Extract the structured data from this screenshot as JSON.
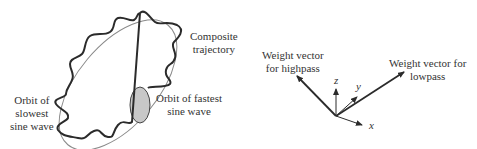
{
  "left_panel": {
    "composite_label": [
      "Composite",
      "trajectory"
    ],
    "slowest_label": [
      "Orbit of",
      "slowest",
      "sine wave"
    ],
    "fastest_label": [
      "Orbit of fastest",
      "sine wave"
    ]
  },
  "right_panel": {
    "highpass_label": [
      "Weight vector",
      "for highpass"
    ],
    "lowpass_label": [
      "Weight vector for",
      "lowpass"
    ],
    "axes": {
      "x": "x",
      "y": "y",
      "z": "z"
    }
  },
  "colors": {
    "wave": "#2b2b2b",
    "orbit": "#8a8a8a",
    "fast_orbit_fill": "#c8c8c8",
    "vector": "#2b2b2b"
  }
}
